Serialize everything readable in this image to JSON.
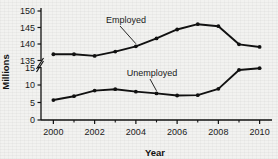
{
  "chart_data": {
    "type": "line",
    "title": "",
    "xlabel": "Year",
    "ylabel": "Millions",
    "x": [
      2000,
      2001,
      2002,
      2003,
      2004,
      2005,
      2006,
      2007,
      2008,
      2009,
      2010
    ],
    "xtick_labels": [
      "2000",
      "2002",
      "2004",
      "2006",
      "2008",
      "2010"
    ],
    "xtick_values": [
      2000,
      2002,
      2004,
      2006,
      2008,
      2010
    ],
    "xminor_ticks": [
      2001,
      2003,
      2005,
      2007,
      2009
    ],
    "xlim": [
      1999.4,
      2010.6
    ],
    "broken_axis": true,
    "axis_break_marker": "zigzag",
    "y_upper_ticks": [
      135,
      140,
      145,
      150
    ],
    "y_upper_lim": [
      135,
      150
    ],
    "y_lower_ticks": [
      0,
      5,
      10,
      15
    ],
    "y_lower_lim": [
      0,
      15
    ],
    "grid": false,
    "legend_position": "inline-annotations",
    "series": [
      {
        "name": "Employed",
        "axis": "upper",
        "marker": "filled-circle",
        "color": "#111111",
        "values": [
          136.9,
          136.9,
          136.4,
          137.7,
          139.3,
          141.7,
          144.4,
          146.0,
          145.4,
          139.9,
          139.1
        ]
      },
      {
        "name": "Unemployed",
        "axis": "lower",
        "marker": "filled-circle",
        "color": "#111111",
        "values": [
          5.7,
          6.8,
          8.4,
          8.8,
          8.1,
          7.6,
          7.0,
          7.1,
          8.9,
          14.3,
          14.8
        ]
      }
    ],
    "annotations": [
      {
        "text": "Employed",
        "target_x": 2004,
        "target_series": "Employed"
      },
      {
        "text": "Unemployed",
        "target_x": 2005,
        "target_series": "Unemployed"
      }
    ]
  },
  "colors": {
    "ink": "#111111",
    "background": "#f2f2f0",
    "axis": "#2b2b2b"
  }
}
